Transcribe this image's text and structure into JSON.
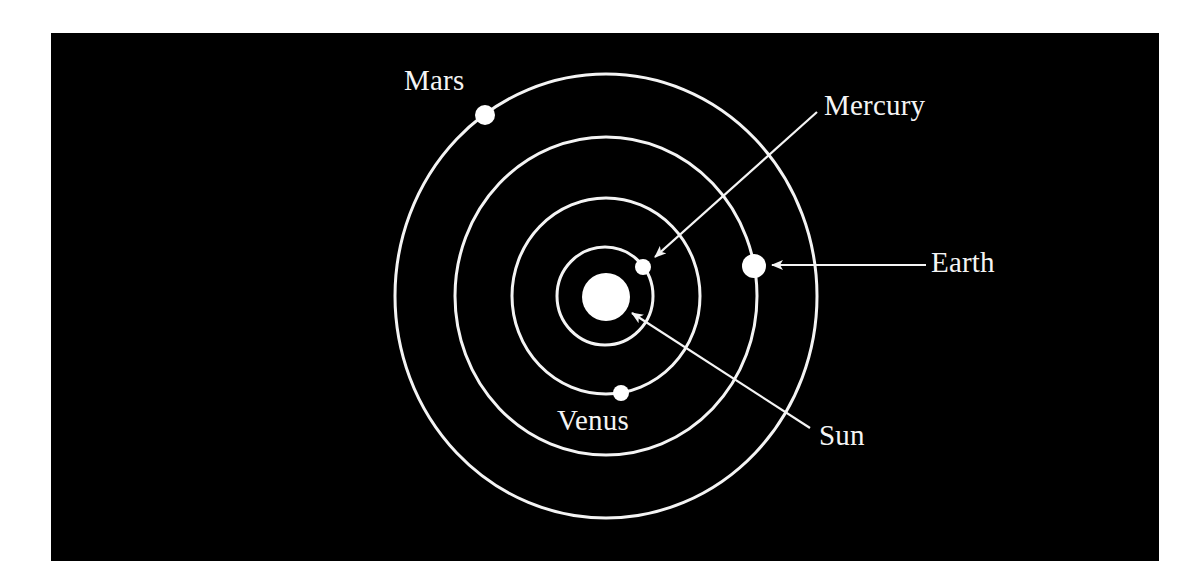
{
  "diagram": {
    "background_color": "#000000",
    "line_color": "#f4f4f4",
    "sun": {
      "label": "Sun",
      "cx": 606,
      "cy": 297,
      "r": 24
    },
    "orbits": [
      {
        "name": "Mercury",
        "cx": 605,
        "cy": 296,
        "rx": 48,
        "ry": 49
      },
      {
        "name": "Venus",
        "cx": 606,
        "cy": 296,
        "rx": 94,
        "ry": 98
      },
      {
        "name": "Earth",
        "cx": 606,
        "cy": 296,
        "rx": 151,
        "ry": 159
      },
      {
        "name": "Mars",
        "cx": 606,
        "cy": 296,
        "rx": 211,
        "ry": 222
      }
    ],
    "planets": [
      {
        "name": "Mercury",
        "label": "Mercury",
        "dot": {
          "cx": 643,
          "cy": 267,
          "r": 8
        }
      },
      {
        "name": "Venus",
        "label": "Venus",
        "dot": {
          "cx": 621,
          "cy": 393,
          "r": 8
        }
      },
      {
        "name": "Earth",
        "label": "Earth",
        "dot": {
          "cx": 754,
          "cy": 266,
          "r": 12
        }
      },
      {
        "name": "Mars",
        "label": "Mars",
        "dot": {
          "cx": 485,
          "cy": 115,
          "r": 10
        }
      }
    ],
    "labels": {
      "mars": "Mars",
      "mercury": "Mercury",
      "earth": "Earth",
      "venus": "Venus",
      "sun": "Sun"
    },
    "leaders": [
      {
        "target": "Mercury",
        "from": [
          817,
          112
        ],
        "to": [
          655,
          257
        ],
        "arrow": true
      },
      {
        "target": "Earth",
        "from": [
          926,
          265
        ],
        "to": [
          772,
          265
        ],
        "arrow": true
      },
      {
        "target": "Sun",
        "from": [
          810,
          428
        ],
        "to": [
          632,
          313
        ],
        "arrow": true
      }
    ]
  }
}
